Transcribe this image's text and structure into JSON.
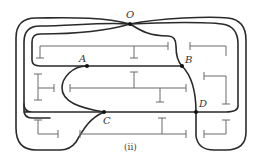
{
  "figure": {
    "caption": "(ii)"
  },
  "nodes": [
    {
      "id": "O",
      "label": "O",
      "x": 130,
      "y": 24
    },
    {
      "id": "A",
      "label": "A",
      "x": 87,
      "y": 66
    },
    {
      "id": "B",
      "label": "B",
      "x": 182,
      "y": 66
    },
    {
      "id": "C",
      "label": "C",
      "x": 104,
      "y": 112
    },
    {
      "id": "D",
      "label": "D",
      "x": 196,
      "y": 112
    }
  ],
  "colors": {
    "path": "#2a2a2a",
    "walls": "#6a6a6a",
    "background": "#ffffff"
  }
}
